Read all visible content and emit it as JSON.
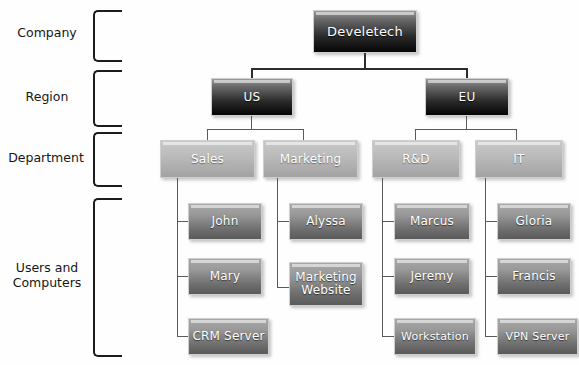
{
  "diagram": {
    "background_color": "#fefefe",
    "line_color": "#2d2d2d",
    "tiers": [
      {
        "id": "company",
        "label": "Company"
      },
      {
        "id": "region",
        "label": "Region"
      },
      {
        "id": "department",
        "label": "Department"
      },
      {
        "id": "users",
        "label": "Users and\nComputers"
      }
    ],
    "nodes": {
      "company": {
        "label": "Develetech",
        "style": "dark"
      },
      "regions": [
        {
          "label": "US",
          "style": "dark"
        },
        {
          "label": "EU",
          "style": "dark"
        }
      ],
      "departments": [
        {
          "label": "Sales",
          "style": "dept",
          "parent": "US"
        },
        {
          "label": "Marketing",
          "style": "dept",
          "parent": "US"
        },
        {
          "label": "R&D",
          "style": "dept",
          "parent": "EU"
        },
        {
          "label": "IT",
          "style": "dept",
          "parent": "EU"
        }
      ],
      "leaves": {
        "sales": [
          {
            "label": "John"
          },
          {
            "label": "Mary"
          },
          {
            "label": "CRM Server"
          }
        ],
        "marketing": [
          {
            "label": "Alyssa"
          },
          {
            "label": "Marketing\nWebsite"
          }
        ],
        "rnd": [
          {
            "label": "Marcus"
          },
          {
            "label": "Jeremy"
          },
          {
            "label": "Workstation"
          }
        ],
        "it": [
          {
            "label": "Gloria"
          },
          {
            "label": "Francis"
          },
          {
            "label": "VPN Server"
          }
        ]
      }
    }
  }
}
